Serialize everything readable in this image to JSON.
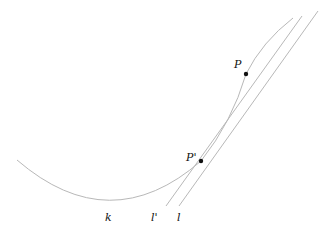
{
  "labels": {
    "P": "P",
    "P_prime": "P'",
    "k": "k",
    "l_prime": "l'",
    "l": "l"
  },
  "colors": {
    "line": "#b8b8b8",
    "point": "#111111"
  }
}
